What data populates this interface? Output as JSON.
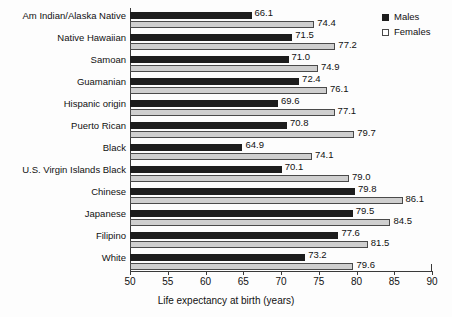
{
  "chart_data": {
    "type": "bar",
    "orientation": "horizontal",
    "title": "",
    "xlabel": "Life expectancy at birth (years)",
    "ylabel": "",
    "xlim": [
      50,
      90
    ],
    "xticks": [
      50,
      55,
      60,
      65,
      70,
      75,
      80,
      85,
      90
    ],
    "grid": false,
    "legend_position": "top-right",
    "categories": [
      "Am Indian/Alaska Native",
      "Native Hawaiian",
      "Samoan",
      "Guamanian",
      "Hispanic origin",
      "Puerto Rican",
      "Black",
      "U.S. Virgin Islands Black",
      "Chinese",
      "Japanese",
      "Filipino",
      "White"
    ],
    "series": [
      {
        "name": "Males",
        "color": "#1d1d1d",
        "values": [
          66.1,
          71.5,
          71.0,
          72.4,
          69.6,
          70.8,
          64.9,
          70.1,
          79.8,
          79.5,
          77.6,
          73.2
        ]
      },
      {
        "name": "Females",
        "color": "#cfcfcf",
        "values": [
          74.4,
          77.2,
          74.9,
          76.1,
          77.1,
          79.7,
          74.1,
          79.0,
          86.1,
          84.5,
          81.5,
          79.6
        ]
      }
    ]
  },
  "legend": {
    "items": [
      {
        "label": "Males"
      },
      {
        "label": "Females"
      }
    ]
  },
  "axis": {
    "title": "Life expectancy at birth (years)"
  }
}
